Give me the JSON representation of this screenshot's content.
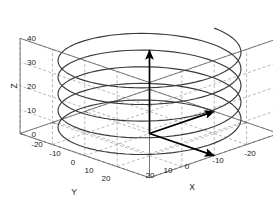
{
  "figure": {
    "background_color": "#ffffff",
    "plot_type": "3d-line",
    "grid_color": "#9a9a9a",
    "axis_color": "#6e6e6e",
    "curve_color": "#3a3a3a",
    "vector_color": "#000000"
  },
  "chart_data": {
    "type": "line",
    "title": "",
    "xlabel": "X",
    "ylabel": "Y",
    "zlabel": "Z",
    "projection": "3d",
    "grid": true,
    "legend": "none",
    "xlim": [
      -20,
      20
    ],
    "ylim": [
      -20,
      20
    ],
    "zlim": [
      0,
      40
    ],
    "xticks": [
      20,
      10,
      0,
      -10,
      -20
    ],
    "yticks": [
      -20,
      -10,
      0,
      10,
      20
    ],
    "zticks": [
      0,
      10,
      20,
      30,
      40
    ],
    "xticklabels": [
      "20",
      "10",
      "0",
      "-10",
      "-20"
    ],
    "yticklabels": [
      "-20",
      "-10",
      "0",
      "10",
      "20"
    ],
    "zticklabels": [
      "0",
      "10",
      "20",
      "30",
      "40"
    ],
    "series": [
      {
        "name": "helix",
        "description": "5-turn helix of radius 20 rising from z=0 to z=35",
        "radius": 20,
        "turns": 5,
        "z_start": 0,
        "z_end": 35,
        "points_per_turn": 72
      }
    ],
    "annotations": [
      {
        "name": "z-vector-arrow",
        "from": [
          0,
          0,
          0
        ],
        "to": [
          0,
          0,
          35
        ],
        "style": "arrow"
      },
      {
        "name": "x-vector-arrow",
        "from": [
          0,
          0,
          0
        ],
        "to": [
          20,
          0,
          0
        ],
        "style": "arrow"
      },
      {
        "name": "y-vector-arrow",
        "from": [
          0,
          0,
          0
        ],
        "to": [
          0,
          -20,
          0
        ],
        "style": "arrow"
      }
    ]
  },
  "axes": {
    "x": {
      "label": "X",
      "ticks": [
        {
          "value": "20",
          "px": 150,
          "py": 178
        },
        {
          "value": "10",
          "px": 168,
          "py": 173
        },
        {
          "value": "0",
          "px": 187,
          "py": 169
        },
        {
          "value": "-10",
          "px": 218,
          "py": 163
        },
        {
          "value": "-20",
          "px": 250,
          "py": 156
        }
      ],
      "label_px": 192,
      "label_py": 190
    },
    "y": {
      "label": "Y",
      "ticks": [
        {
          "value": "-20",
          "px": 37,
          "py": 147
        },
        {
          "value": "-10",
          "px": 55,
          "py": 156
        },
        {
          "value": "0",
          "px": 73,
          "py": 165
        },
        {
          "value": "10",
          "px": 89,
          "py": 173
        },
        {
          "value": "20",
          "px": 106,
          "py": 181
        }
      ],
      "label_px": 74,
      "label_py": 195
    },
    "z": {
      "label": "Z",
      "ticks": [
        {
          "value": "40",
          "px": 34,
          "py": 38
        },
        {
          "value": "30",
          "px": 34,
          "py": 62
        },
        {
          "value": "20",
          "px": 34,
          "py": 86
        },
        {
          "value": "10",
          "px": 34,
          "py": 110
        },
        {
          "value": "0",
          "px": 34,
          "py": 134
        }
      ],
      "label_px": 17,
      "label_py": 86
    }
  }
}
